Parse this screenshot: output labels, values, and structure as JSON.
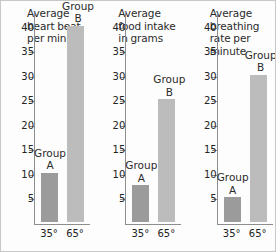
{
  "chart_data": [
    {
      "type": "bar",
      "title": "Average heart beat per minute",
      "categories": [
        "35°",
        "65°"
      ],
      "bar_labels": [
        "Group A",
        "Group B"
      ],
      "values": [
        10,
        40
      ],
      "value_labels": [
        "10",
        "40"
      ],
      "xlabel": "",
      "ylabel": "",
      "ylim": [
        0,
        43
      ],
      "yticks": [
        5,
        10,
        15,
        20,
        25,
        30,
        35,
        40
      ],
      "grid": false,
      "legend": "none"
    },
    {
      "type": "bar",
      "title": "Average food intake in grams",
      "categories": [
        "35°",
        "65°"
      ],
      "bar_labels": [
        "Group A",
        "Group B"
      ],
      "values": [
        7.5,
        25
      ],
      "value_labels": [
        "7.5",
        "25"
      ],
      "xlabel": "",
      "ylabel": "",
      "ylim": [
        0,
        43
      ],
      "yticks": [
        5,
        10,
        15,
        20,
        25,
        30,
        35,
        40
      ],
      "grid": false,
      "legend": "none"
    },
    {
      "type": "bar",
      "title": "Average breathing rate per minute",
      "categories": [
        "35°",
        "65°"
      ],
      "bar_labels": [
        "Group A",
        "Group B"
      ],
      "values": [
        5,
        30
      ],
      "value_labels": [
        "5",
        "30"
      ],
      "xlabel": "",
      "ylabel": "",
      "ylim": [
        0,
        43
      ],
      "yticks": [
        5,
        10,
        15,
        20,
        25,
        30,
        35,
        40
      ],
      "grid": false,
      "legend": "none"
    }
  ],
  "panels": [
    {
      "title": "Average heart beat per minute",
      "group_a_label_line1": "Group",
      "group_a_label_line2": "A",
      "group_b_label_line1": "Group",
      "group_b_label_line2": "B",
      "x_a": "35°",
      "x_b": "65°",
      "ticks": [
        "40",
        "35",
        "30",
        "25",
        "20",
        "15",
        "10",
        "5"
      ]
    },
    {
      "title": "Average food intake in grams",
      "group_a_label_line1": "Group",
      "group_a_label_line2": "A",
      "group_b_label_line1": "Group",
      "group_b_label_line2": "B",
      "x_a": "35°",
      "x_b": "65°",
      "ticks": [
        "40",
        "35",
        "30",
        "25",
        "20",
        "15",
        "10",
        "5"
      ]
    },
    {
      "title": "Average breathing rate per minute",
      "group_a_label_line1": "Group",
      "group_a_label_line2": "A",
      "group_b_label_line1": "Group",
      "group_b_label_line2": "B",
      "x_a": "35°",
      "x_b": "65°",
      "ticks": [
        "40",
        "35",
        "30",
        "25",
        "20",
        "15",
        "10",
        "5"
      ]
    }
  ],
  "colors": {
    "bar_group_a": "#9b9b9b",
    "bar_group_b": "#bcbcbc",
    "axis": "#8d8d8d",
    "text": "#232323",
    "background": "#fdfdfd",
    "border": "#c8c8c8"
  }
}
